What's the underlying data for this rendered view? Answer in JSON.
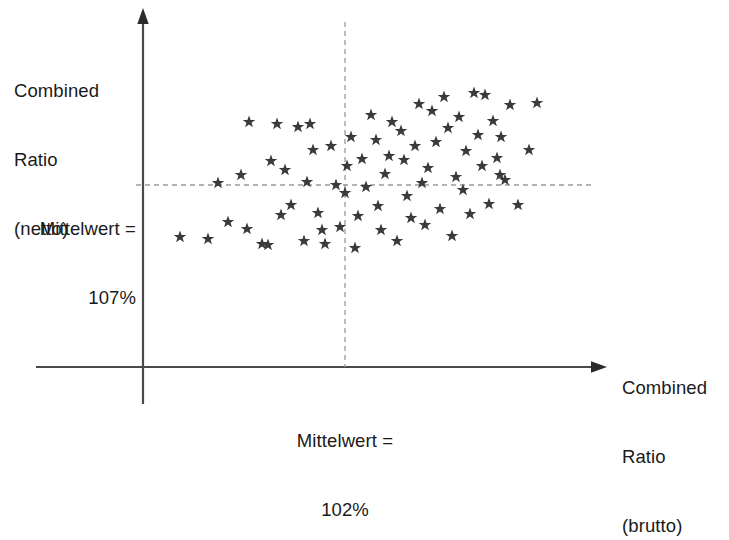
{
  "chart_data": {
    "type": "scatter",
    "title": "",
    "xlabel": "Combined Ratio (brutto)",
    "ylabel": "Combined Ratio (netto)",
    "x_axis": {
      "label_lines": [
        "Combined",
        "Ratio",
        "(brutto)"
      ],
      "mean_label_lines": [
        "Mittelwert =",
        "102%"
      ],
      "mean_value": "102%",
      "mean_reference_line": "vertical-dashed"
    },
    "y_axis": {
      "label_lines": [
        "Combined",
        "Ratio",
        "(netto)"
      ],
      "mean_label_lines": [
        "Mittelwert =",
        "107%"
      ],
      "mean_value": "107%",
      "mean_reference_line": "horizontal-dashed"
    },
    "grid": false,
    "legend": null,
    "marker": "star",
    "marker_color": "#3a3a3c",
    "axis_color": "#4a4a4a",
    "dashed_line_color": "#8a8a8a",
    "n_points": 74,
    "points": [
      [
        180,
        237
      ],
      [
        208,
        239
      ],
      [
        218,
        183
      ],
      [
        228,
        222
      ],
      [
        241,
        175
      ],
      [
        247,
        229
      ],
      [
        249,
        122
      ],
      [
        262,
        244
      ],
      [
        268,
        245
      ],
      [
        271,
        161
      ],
      [
        277,
        124
      ],
      [
        281,
        215
      ],
      [
        285,
        170
      ],
      [
        291,
        205
      ],
      [
        298,
        127
      ],
      [
        304,
        241
      ],
      [
        307,
        182
      ],
      [
        310,
        124
      ],
      [
        313,
        150
      ],
      [
        318,
        213
      ],
      [
        322,
        230
      ],
      [
        325,
        244
      ],
      [
        331,
        146
      ],
      [
        336,
        185
      ],
      [
        340,
        227
      ],
      [
        345,
        193
      ],
      [
        347,
        166
      ],
      [
        351,
        137
      ],
      [
        355,
        248
      ],
      [
        358,
        216
      ],
      [
        362,
        159
      ],
      [
        366,
        187
      ],
      [
        371,
        115
      ],
      [
        376,
        140
      ],
      [
        378,
        206
      ],
      [
        381,
        230
      ],
      [
        385,
        174
      ],
      [
        389,
        156
      ],
      [
        392,
        122
      ],
      [
        397,
        241
      ],
      [
        401,
        131
      ],
      [
        404,
        160
      ],
      [
        407,
        196
      ],
      [
        411,
        218
      ],
      [
        415,
        146
      ],
      [
        419,
        104
      ],
      [
        422,
        183
      ],
      [
        425,
        225
      ],
      [
        428,
        168
      ],
      [
        432,
        111
      ],
      [
        436,
        142
      ],
      [
        440,
        209
      ],
      [
        444,
        97
      ],
      [
        448,
        128
      ],
      [
        452,
        236
      ],
      [
        456,
        177
      ],
      [
        459,
        117
      ],
      [
        463,
        190
      ],
      [
        466,
        151
      ],
      [
        470,
        214
      ],
      [
        474,
        93
      ],
      [
        478,
        135
      ],
      [
        482,
        166
      ],
      [
        485,
        95
      ],
      [
        489,
        204
      ],
      [
        493,
        121
      ],
      [
        497,
        158
      ],
      [
        501,
        137
      ],
      [
        505,
        180
      ],
      [
        510,
        105
      ],
      [
        518,
        205
      ],
      [
        529,
        150
      ],
      [
        537,
        103
      ],
      [
        500,
        175
      ]
    ]
  },
  "labels": {
    "y_axis_title": {
      "line1": "Combined",
      "line2": "Ratio",
      "line3": "(netto)"
    },
    "x_axis_title": {
      "line1": "Combined",
      "line2": "Ratio",
      "line3": "(brutto)"
    },
    "y_mean": {
      "line1": "Mittelwert =",
      "line2": "107%"
    },
    "x_mean": {
      "line1": "Mittelwert =",
      "line2": "102%"
    }
  }
}
